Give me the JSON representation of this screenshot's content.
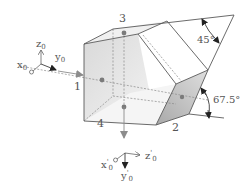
{
  "figure": {
    "type": "3d-prism-schematic",
    "colors": {
      "edge": "#5a5a5a",
      "hidden_edge": "#8a8a8a",
      "face_front": "#e2e2e2",
      "face_top": "#f2f2f2",
      "face_bottom": "#f4f4f4",
      "face_slant": "#ffffff",
      "face_2": "#bdbdbd",
      "dot": "#7a7a7a",
      "beam_arrow": "#8c8c8c",
      "dark_arrow": "#222222",
      "label": "#555555"
    },
    "face_labels": {
      "face_1": "1",
      "face_2": "2",
      "face_3": "3",
      "face_4": "4"
    },
    "angles": {
      "top_angle": "45°",
      "side_angle": "67.5°"
    },
    "input_axes": {
      "z": "z",
      "z_sub": "0",
      "y": "y",
      "y_sub": "0",
      "x": "x",
      "x_sub": "0"
    },
    "output_axes": {
      "x": "x",
      "x_prime": "'",
      "x_sub": "0",
      "z": "z",
      "z_prime": "'",
      "z_sub": "0",
      "y": "y",
      "y_prime": "'",
      "y_sub": "0"
    }
  }
}
